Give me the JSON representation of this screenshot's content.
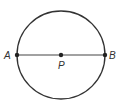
{
  "diagram": {
    "type": "circle-with-diameter",
    "circle": {
      "cx": 61,
      "cy": 55,
      "r": 44,
      "stroke": "#333333"
    },
    "diameter": {
      "from": "A",
      "to": "B"
    },
    "points": [
      {
        "id": "A",
        "label": "A",
        "x": 17,
        "y": 55,
        "label_x": 4,
        "label_y": 59
      },
      {
        "id": "P",
        "label": "P",
        "x": 61,
        "y": 55,
        "label_x": 58,
        "label_y": 69
      },
      {
        "id": "B",
        "label": "B",
        "x": 105,
        "y": 55,
        "label_x": 109,
        "label_y": 59
      }
    ]
  }
}
